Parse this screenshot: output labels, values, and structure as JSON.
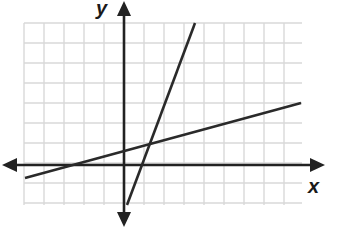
{
  "graph": {
    "x_label": "x",
    "y_label": "y",
    "grid": {
      "left": 24,
      "top": 23,
      "right": 302,
      "bottom": 205,
      "cell": 20,
      "color": "#d9d9d9"
    },
    "axes": {
      "origin_px": [
        124,
        165
      ],
      "color": "#222222"
    },
    "lines": [
      {
        "name": "steep-line",
        "from_px": [
          127,
          205
        ],
        "to_px": [
          195,
          23
        ],
        "color": "#2a2a2a"
      },
      {
        "name": "shallow-line",
        "from_px": [
          25,
          178
        ],
        "to_px": [
          301,
          103
        ],
        "color": "#2a2a2a"
      }
    ]
  }
}
